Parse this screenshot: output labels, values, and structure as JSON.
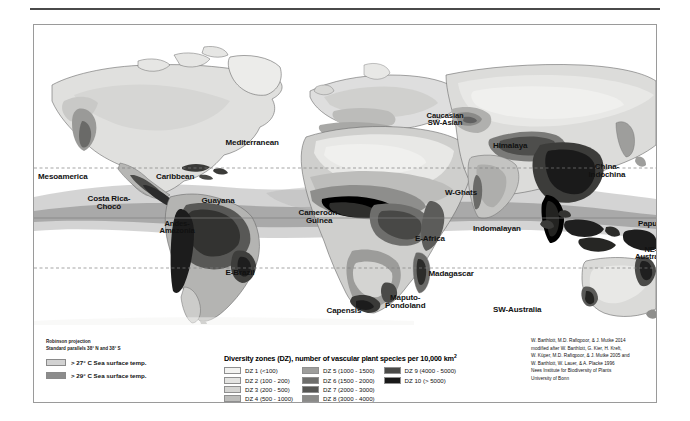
{
  "figure": {
    "projection_lines": [
      "Robinson projection",
      "Standard parallels 38° N and 38° S"
    ],
    "sea_surface_temp": [
      {
        "label": "> 27° C Sea surface temp.",
        "color": "#d2d2d2"
      },
      {
        "label": "> 29° C Sea surface temp.",
        "color": "#8c8c8c"
      }
    ],
    "legend": {
      "title": "Diversity zones (DZ), number of vascular plant species per 10,000 km",
      "title_superscript": "2",
      "columns": [
        [
          {
            "label": "DZ 1 (<100)",
            "color": "#f2f2f0"
          },
          {
            "label": "DZ 2 (100 - 200)",
            "color": "#e3e3e1"
          },
          {
            "label": "DZ 3 (200 - 500)",
            "color": "#d4d4d2"
          },
          {
            "label": "DZ 4 (500 - 1000)",
            "color": "#bdbdbb"
          }
        ],
        [
          {
            "label": "DZ 5 (1000 - 1500)",
            "color": "#9e9e9c"
          },
          {
            "label": "DZ 6 (1500 - 2000)",
            "color": "#6e6e6c"
          },
          {
            "label": "DZ 7 (2000 - 3000)",
            "color": "#565654"
          },
          {
            "label": "DZ 8 (3000 - 4000)",
            "color": "#8a8a88"
          }
        ],
        [
          {
            "label": "DZ 9 (4000 - 5000)",
            "color": "#4a4a48"
          },
          {
            "label": "DZ 10 (> 5000)",
            "color": "#191919"
          }
        ]
      ]
    },
    "credits": [
      "W. Barthlott, M.D. Rafiqpoor, & J. Mutke 2014",
      "modified after W. Barthlott, G. Kier, H. Kreft,",
      "W. Küper, M.D. Rafiqpoor, & J. Mutke 2005 and",
      "W. Barthlott, W. Lauer, & A. Placke 1996",
      "Nees Institute for Biodiversity of Plants",
      "University of Bonn"
    ],
    "map_labels": [
      {
        "text": "Mesoamerica",
        "x": 29,
        "y": 152,
        "size": 8.0
      },
      {
        "text": "Caribbean",
        "x": 141,
        "y": 152,
        "size": 8.0
      },
      {
        "text": "Costa Rica-\nChocó",
        "x": 75,
        "y": 178,
        "size": 8.0
      },
      {
        "text": "Guayana",
        "x": 184,
        "y": 176,
        "size": 8.0
      },
      {
        "text": "Andes-\nAmazonia",
        "x": 143,
        "y": 202,
        "size": 7.6
      },
      {
        "text": "E-Brazil",
        "x": 206,
        "y": 248,
        "size": 8.0
      },
      {
        "text": "Mediterranean",
        "x": 218,
        "y": 118,
        "size": 8.0
      },
      {
        "text": "Cameroon-\nGuinea",
        "x": 285,
        "y": 192,
        "size": 8.0
      },
      {
        "text": "E-Africa",
        "x": 396,
        "y": 214,
        "size": 8.0
      },
      {
        "text": "Madagascar",
        "x": 417,
        "y": 249,
        "size": 8.0
      },
      {
        "text": "Capensis",
        "x": 310,
        "y": 286,
        "size": 8.0
      },
      {
        "text": "Maputo-\nPondoland",
        "x": 371,
        "y": 277,
        "size": 8.0
      },
      {
        "text": "Caucasian\nSW-Asian",
        "x": 411,
        "y": 94,
        "size": 7.6
      },
      {
        "text": "Himalaya",
        "x": 476,
        "y": 121,
        "size": 8.0
      },
      {
        "text": "W-Ghats",
        "x": 427,
        "y": 168,
        "size": 8.0
      },
      {
        "text": "China-\nIndochina",
        "x": 573,
        "y": 146,
        "size": 8.0
      },
      {
        "text": "Indomalayan",
        "x": 463,
        "y": 204,
        "size": 8.0
      },
      {
        "text": "Papua",
        "x": 616,
        "y": 199,
        "size": 8.0
      },
      {
        "text": "NE-\nAustralia",
        "x": 617,
        "y": 228,
        "size": 7.6
      },
      {
        "text": "SW-Australia",
        "x": 483,
        "y": 285,
        "size": 8.0
      }
    ]
  }
}
